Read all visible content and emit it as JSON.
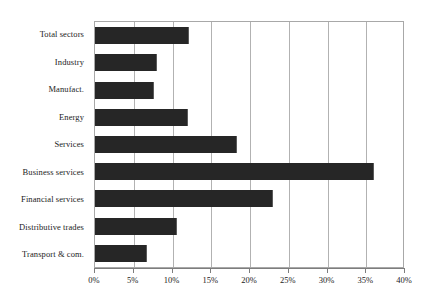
{
  "chart_data": {
    "type": "bar",
    "orientation": "horizontal",
    "title": "",
    "subtitle": "",
    "xlabel": "",
    "ylabel": "",
    "xlim": [
      0,
      40
    ],
    "xtick_step": 5,
    "grid": true,
    "legend": false,
    "legend_position": "none",
    "bar_color": "#262626",
    "gridline_color": "#b2b2b2",
    "axis_color": "#7d7d7d",
    "background_color": "#ffffff",
    "value_suffix": "%",
    "categories": [
      "Total sectors",
      "Industry",
      "Manufact.",
      "Energy",
      "Services",
      "Business services",
      "Financial services",
      "Distributive trades",
      "Transport & com."
    ],
    "values": [
      12.1,
      8.0,
      7.6,
      12.0,
      18.3,
      36.0,
      23.0,
      10.6,
      6.7
    ],
    "xticks": [
      0,
      5,
      10,
      15,
      20,
      25,
      30,
      35,
      40
    ],
    "xticklabels": [
      "0%",
      "5%",
      "10%",
      "15%",
      "20%",
      "25%",
      "30%",
      "35%",
      "40%"
    ]
  }
}
